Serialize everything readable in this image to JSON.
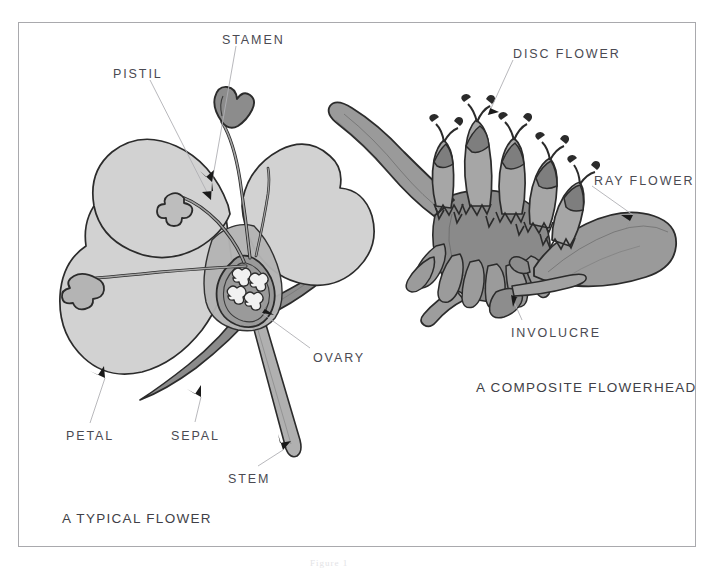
{
  "plate": {
    "background_color": "#ffffff",
    "frame_color": "#a9a9ad",
    "label_color": "#4a4a52",
    "caption_color": "#3f3f47"
  },
  "palette": {
    "ink": "#2b2b2b",
    "petal_light": "#d2d2d2",
    "petal_mid": "#b8b8b8",
    "organ_mid": "#a8a8a8",
    "organ_dark": "#8f8f8f",
    "sepal_dark": "#8b8b8b",
    "ovary_dark": "#9a9a9a",
    "leader_line": "#b0b0b4",
    "arrow": "#1a1a1a"
  },
  "figures": [
    {
      "id": "typical-flower",
      "caption": "A TYPICAL FLOWER",
      "caption_position": {
        "x": 62,
        "y": 512
      },
      "labels": [
        {
          "id": "pistil",
          "text": "PISTIL",
          "x": 113,
          "y": 68,
          "leader": {
            "x1": 150,
            "y1": 80,
            "x2": 211,
            "y2": 200
          },
          "arrow_angle": 63
        },
        {
          "id": "stamen",
          "text": "STAMEN",
          "x": 222,
          "y": 34,
          "leader": {
            "x1": 236,
            "y1": 46,
            "x2": 212,
            "y2": 182
          },
          "arrow_angle": 100
        },
        {
          "id": "ovary",
          "text": "OVARY",
          "x": 313,
          "y": 352,
          "leader": {
            "x1": 310,
            "y1": 348,
            "x2": 262,
            "y2": 313
          },
          "arrow_angle": 216
        },
        {
          "id": "petal",
          "text": "PETAL",
          "x": 66,
          "y": 430,
          "leader": {
            "x1": 90,
            "y1": 423,
            "x2": 105,
            "y2": 378
          },
          "arrow_angle": 290
        },
        {
          "id": "sepal",
          "text": "SEPAL",
          "x": 171,
          "y": 430,
          "leader": {
            "x1": 195,
            "y1": 422,
            "x2": 201,
            "y2": 397
          },
          "arrow_angle": 285
        },
        {
          "id": "stem",
          "text": "STEM",
          "x": 228,
          "y": 473,
          "leader": {
            "x1": 258,
            "y1": 466,
            "x2": 283,
            "y2": 450
          },
          "arrow_angle": 322
        }
      ]
    },
    {
      "id": "composite-flowerhead",
      "caption": "A COMPOSITE FLOWERHEAD",
      "caption_position": {
        "x": 476,
        "y": 381
      },
      "labels": [
        {
          "id": "disc-flower",
          "text": "DISC FLOWER",
          "x": 513,
          "y": 48,
          "leader": {
            "x1": 513,
            "y1": 60,
            "x2": 488,
            "y2": 115
          },
          "arrow_angle": 206
        },
        {
          "id": "ray-flower",
          "text": "RAY FLOWER",
          "x": 594,
          "y": 175,
          "leader": {
            "x1": 592,
            "y1": 186,
            "x2": 633,
            "y2": 215
          },
          "arrow_angle": 216
        },
        {
          "id": "involucre",
          "text": "INVOLUCRE",
          "x": 511,
          "y": 327,
          "leader": {
            "x1": 522,
            "y1": 320,
            "x2": 511,
            "y2": 295
          },
          "arrow_angle": 294
        }
      ]
    }
  ],
  "edge_marks": [
    {
      "text": "Figure 1",
      "x": 310,
      "y": 560
    }
  ]
}
